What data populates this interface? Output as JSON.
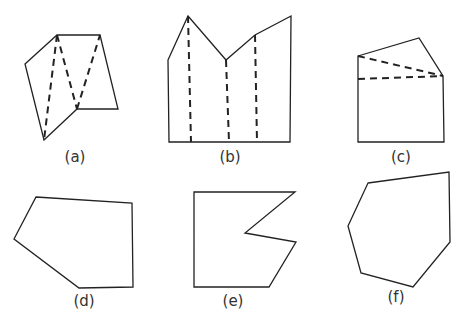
{
  "figures": [
    {
      "label": "(a)",
      "label_pos": [
        75,
        162
      ],
      "vertices": [
        [
          25,
          64
        ],
        [
          57,
          35
        ],
        [
          100,
          35
        ],
        [
          118,
          109
        ],
        [
          77,
          109
        ],
        [
          44,
          140
        ]
      ],
      "diagonals": [
        [
          [
            57,
            35
          ],
          [
            44,
            140
          ]
        ],
        [
          [
            57,
            35
          ],
          [
            77,
            109
          ]
        ],
        [
          [
            77,
            109
          ],
          [
            100,
            35
          ]
        ]
      ]
    },
    {
      "label": "(b)",
      "label_pos": [
        230,
        162
      ],
      "vertices": [
        [
          168,
          60
        ],
        [
          188,
          16
        ],
        [
          226,
          60
        ],
        [
          255,
          35
        ],
        [
          291,
          16
        ],
        [
          290,
          142
        ],
        [
          169,
          142
        ]
      ],
      "diagonals": [
        [
          [
            188,
            16
          ],
          [
            191,
            142
          ]
        ],
        [
          [
            226,
            60
          ],
          [
            229,
            142
          ]
        ],
        [
          [
            255,
            35
          ],
          [
            257,
            142
          ]
        ]
      ]
    },
    {
      "label": "(c)",
      "label_pos": [
        401,
        162
      ],
      "vertices": [
        [
          358,
          56
        ],
        [
          419,
          38
        ],
        [
          443,
          76
        ],
        [
          444,
          142
        ],
        [
          358,
          142
        ]
      ],
      "diagonals": [
        [
          [
            358,
            56
          ],
          [
            443,
            76
          ]
        ],
        [
          [
            358,
            79
          ],
          [
            443,
            76
          ]
        ]
      ]
    },
    {
      "label": "(d)",
      "label_pos": [
        84,
        306
      ],
      "vertices": [
        [
          36,
          197
        ],
        [
          132,
          203
        ],
        [
          133,
          287
        ],
        [
          79,
          288
        ],
        [
          14,
          239
        ]
      ],
      "diagonals": []
    },
    {
      "label": "(e)",
      "label_pos": [
        233,
        306
      ],
      "vertices": [
        [
          194,
          192
        ],
        [
          295,
          192
        ],
        [
          245,
          233
        ],
        [
          296,
          242
        ],
        [
          269,
          287
        ],
        [
          194,
          287
        ]
      ],
      "diagonals": []
    },
    {
      "label": "(f)",
      "label_pos": [
        396,
        302
      ],
      "vertices": [
        [
          368,
          183
        ],
        [
          449,
          172
        ],
        [
          450,
          242
        ],
        [
          413,
          287
        ],
        [
          361,
          273
        ],
        [
          348,
          226
        ]
      ],
      "diagonals": []
    }
  ]
}
